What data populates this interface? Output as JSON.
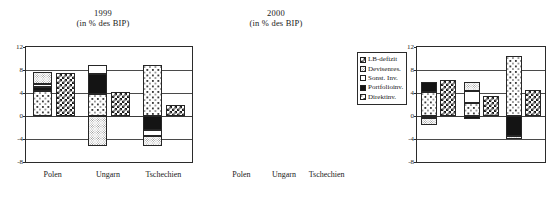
{
  "chart_data": [
    {
      "type": "bar",
      "title": "1999",
      "subtitle": "(in % des BIP)",
      "xlabel": "",
      "ylabel": "",
      "ylim": [
        -8,
        12
      ],
      "yticks": [
        12,
        8,
        4,
        0,
        -4,
        -8
      ],
      "grid": true,
      "stacked": true,
      "categories": [
        "Polen",
        "Ungarn",
        "Tschechien"
      ],
      "legend_position": "right",
      "series": [
        {
          "name": "Direktinv.",
          "values": [
            4.3,
            3.8,
            8.8
          ]
        },
        {
          "name": "Portfolioinv.",
          "values": [
            0.7,
            3.5,
            -2.4
          ]
        },
        {
          "name": "Sonst. Inv.",
          "values": [
            0.5,
            1.5,
            -1.0
          ]
        },
        {
          "name": "Devisenres.",
          "values": [
            2.1,
            -5.3,
            -1.8
          ]
        },
        {
          "name": "LB-defizit",
          "values": [
            7.5,
            4.2,
            2.0
          ]
        }
      ]
    },
    {
      "type": "bar",
      "title": "2000",
      "subtitle": "(in % des BIP)",
      "xlabel": "",
      "ylabel": "",
      "ylim": [
        -8,
        12
      ],
      "yticks": [
        12,
        8,
        4,
        0,
        -4,
        -8
      ],
      "grid": true,
      "stacked": true,
      "categories": [
        "Polen",
        "Ungarn",
        "Tschechien"
      ],
      "legend_position": "right",
      "series": [
        {
          "name": "Direktinv.",
          "values": [
            4.1,
            2.2,
            10.4
          ]
        },
        {
          "name": "Portfolioinv.",
          "values": [
            1.9,
            -0.5,
            -3.4
          ]
        },
        {
          "name": "Sonst. Inv.",
          "values": [
            -0.3,
            2.2,
            0.0
          ]
        },
        {
          "name": "Devisenres.",
          "values": [
            -1.2,
            1.6,
            -0.6
          ]
        },
        {
          "name": "LB-defizit",
          "values": [
            6.3,
            3.4,
            4.6
          ]
        }
      ]
    }
  ],
  "panels": [
    {
      "id": "1999",
      "title": "1999",
      "subtitle": "(in % des BIP)",
      "yticks": [
        "12",
        "8",
        "4",
        "0",
        "-4",
        "-8"
      ],
      "xticks": [
        "Polen",
        "Ungarn",
        "Tschechien"
      ]
    },
    {
      "id": "2000",
      "title": "2000",
      "subtitle": "(in % des BIP)",
      "yticks": [
        "12",
        "8",
        "4",
        "0",
        "-4",
        "-8"
      ],
      "xticks": [
        "Polen",
        "Ungarn",
        "Tschechien"
      ]
    }
  ],
  "legend": {
    "items": [
      {
        "label": "LB-defizit",
        "pattern": "checkerboard",
        "color": "#1d1d1d"
      },
      {
        "label": "Devisenres.",
        "pattern": "fine-dots",
        "color": "#8d8d8d"
      },
      {
        "label": "Sonst. Inv.",
        "pattern": "solid-white",
        "color": "#ffffff"
      },
      {
        "label": "Portfolioinv.",
        "pattern": "solid-black",
        "color": "#141414"
      },
      {
        "label": "Direktinv.",
        "pattern": "speckle",
        "color": "#3a3a3a"
      }
    ]
  }
}
